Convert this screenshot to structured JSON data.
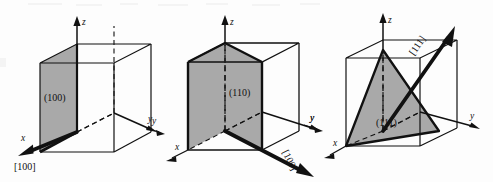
{
  "figure": {
    "background_color": "#fdfdfd",
    "ink_color": "#111111",
    "shade_color": "#a9a9a9",
    "panel_count": 3
  },
  "panels": [
    {
      "id": "panel-1",
      "plane_label": "(100)",
      "direction_label": "[100]",
      "plane_type": "face",
      "axes": [
        {
          "name": "z-axis",
          "label": "z"
        },
        {
          "name": "y-axis",
          "label": "y"
        },
        {
          "name": "x-axis",
          "label": "x"
        }
      ]
    },
    {
      "id": "panel-2",
      "plane_label": "(110)",
      "direction_label": "[100]",
      "plane_type": "diagonal",
      "axes": [
        {
          "name": "z-axis",
          "label": "z"
        },
        {
          "name": "y-axis",
          "label": "y"
        },
        {
          "name": "x-axis",
          "label": "x"
        }
      ]
    },
    {
      "id": "panel-3",
      "plane_label": "(111)",
      "direction_label": "[111]",
      "plane_type": "triangle",
      "axes": [
        {
          "name": "z-axis",
          "label": "z"
        },
        {
          "name": "y-axis",
          "label": "y"
        },
        {
          "name": "x-axis",
          "label": "x"
        }
      ]
    }
  ],
  "extra_axis_labels": {
    "panel2_left_y": "y",
    "panel3_left_y": "y"
  }
}
